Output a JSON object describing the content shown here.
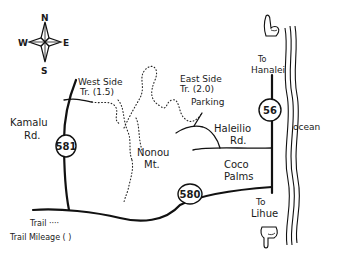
{
  "map": {
    "compass": {
      "north": "N",
      "south": "S",
      "east": "E",
      "west": "W"
    },
    "labels": {
      "west_side_trail_line1": "West Side",
      "west_side_trail_line2": "Tr. (1.5)",
      "east_side_trail_line1": "East Side",
      "east_side_trail_line2": "Tr. (2.0)",
      "parking": "Parking",
      "kamalu_line1": "Kamalu",
      "kamalu_line2": "Rd.",
      "haleilio_line1": "Haleilio",
      "haleilio_line2": "Rd.",
      "nonou_line1": "Nonou",
      "nonou_line2": "Mt.",
      "coco_line1": "Coco",
      "coco_line2": "Palms",
      "to_hanalei_line1": "To",
      "to_hanalei_line2": "Hanalei",
      "to_lihue_line1": "To",
      "to_lihue_line2": "Lihue",
      "ocean": "ocean"
    },
    "route_shields": {
      "r581": "581",
      "r580": "580",
      "r56": "56"
    },
    "legend": {
      "trail": "Trail ····",
      "trail_mileage": "Trail Mileage ( )"
    }
  }
}
